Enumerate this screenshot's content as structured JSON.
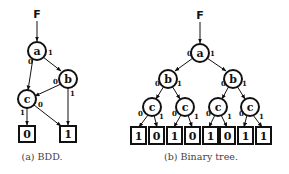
{
  "figure_a": {
    "caption": "(a) BDD.",
    "root": "F",
    "nodes": [
      {
        "id": "a",
        "label": "a"
      },
      {
        "id": "b",
        "label": "b"
      },
      {
        "id": "c",
        "label": "c"
      }
    ],
    "leaves": [
      {
        "id": "t0",
        "label": "0"
      },
      {
        "id": "t1",
        "label": "1"
      }
    ],
    "edges": [
      {
        "from": "a",
        "to": "c",
        "label": "0"
      },
      {
        "from": "a",
        "to": "b",
        "label": "1"
      },
      {
        "from": "b",
        "to": "c",
        "label": "0"
      },
      {
        "from": "b",
        "to": "t1",
        "label": "1"
      },
      {
        "from": "c",
        "to": "t0",
        "label": "1"
      },
      {
        "from": "c",
        "to": "t1",
        "label": "0"
      }
    ]
  },
  "figure_b": {
    "caption": "(b) Binary tree.",
    "root": "F",
    "nodes": [
      {
        "id": "a",
        "label": "a"
      },
      {
        "id": "b0",
        "label": "b"
      },
      {
        "id": "b1",
        "label": "b"
      },
      {
        "id": "c00",
        "label": "c"
      },
      {
        "id": "c01",
        "label": "c"
      },
      {
        "id": "c10",
        "label": "c"
      },
      {
        "id": "c11",
        "label": "c"
      }
    ],
    "leaves": [
      {
        "label": "1"
      },
      {
        "label": "0"
      },
      {
        "label": "1"
      },
      {
        "label": "0"
      },
      {
        "label": "1"
      },
      {
        "label": "0"
      },
      {
        "label": "1"
      },
      {
        "label": "1"
      }
    ],
    "edge_labels": {
      "low": "0",
      "high": "1"
    }
  }
}
